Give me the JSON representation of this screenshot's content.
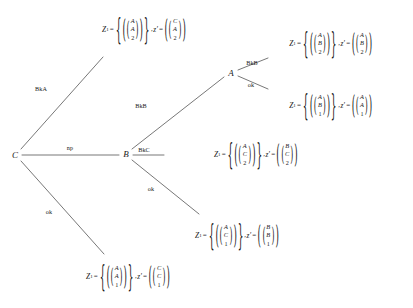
{
  "diagram": {
    "type": "derivation-tree",
    "title": "",
    "background_color": "#ffffff",
    "line_color": "#3c3c3c",
    "text_color": "#1a1a1a",
    "nodes": [
      {
        "id": "root",
        "label": "C",
        "x": 15,
        "y": 155
      },
      {
        "id": "nodeB",
        "label": "B",
        "x": 126,
        "y": 154
      },
      {
        "id": "nodeA",
        "label": "A",
        "x": 231,
        "y": 73
      }
    ],
    "edge_labels": [
      {
        "id": "bka",
        "text": "BkA",
        "x": 41,
        "y": 89
      },
      {
        "id": "np",
        "text": "np",
        "x": 70,
        "y": 148
      },
      {
        "id": "ok_c",
        "text": "ok",
        "x": 49,
        "y": 212
      },
      {
        "id": "bkb_b",
        "text": "BkB",
        "x": 141,
        "y": 106
      },
      {
        "id": "bkc",
        "text": "BkC",
        "x": 144,
        "y": 150
      },
      {
        "id": "ok_b",
        "text": "ok",
        "x": 151,
        "y": 189
      },
      {
        "id": "bkb_a",
        "text": "BkB",
        "x": 252,
        "y": 63
      },
      {
        "id": "ok_a",
        "text": "ok",
        "x": 251,
        "y": 85
      }
    ],
    "expressions": [
      {
        "id": "leaf-bka",
        "x": 144,
        "y": 30,
        "set_symbol": "Z",
        "set_subscript": "1",
        "equals": "=",
        "set_vector": [
          "A",
          "A",
          "2"
        ],
        "separator": ",",
        "z_symbol": "z′",
        "z_equals": "=",
        "z_vector": [
          "C",
          "A",
          "2"
        ]
      },
      {
        "id": "leaf-bkb-a",
        "x": 331,
        "y": 44,
        "set_symbol": "Z",
        "set_subscript": "1",
        "equals": "=",
        "set_vector": [
          "A",
          "B",
          "2"
        ],
        "separator": ",",
        "z_symbol": "z′",
        "z_equals": "=",
        "z_vector": [
          "A",
          "B",
          "2"
        ]
      },
      {
        "id": "leaf-ok-a",
        "x": 331,
        "y": 106,
        "set_symbol": "Z",
        "set_subscript": "1",
        "equals": "=",
        "set_vector": [
          "A",
          "B",
          "1"
        ],
        "separator": ",",
        "z_symbol": "z′",
        "z_equals": "=",
        "z_vector": [
          "A",
          "A",
          "1"
        ]
      },
      {
        "id": "leaf-bkc",
        "x": 256,
        "y": 155,
        "set_symbol": "Z",
        "set_subscript": "1",
        "equals": "=",
        "set_vector": [
          "A",
          "C",
          "2"
        ],
        "separator": ",",
        "z_symbol": "z′",
        "z_equals": "=",
        "z_vector": [
          "B",
          "C",
          "2"
        ]
      },
      {
        "id": "leaf-ok-b",
        "x": 237,
        "y": 236,
        "set_symbol": "Z",
        "set_subscript": "1",
        "equals": "=",
        "set_vector": [
          "A",
          "C",
          "1"
        ],
        "separator": ",",
        "z_symbol": "z′",
        "z_equals": "=",
        "z_vector": [
          "B",
          "B",
          "1"
        ]
      },
      {
        "id": "leaf-ok-c",
        "x": 128,
        "y": 277,
        "set_symbol": "Z",
        "set_subscript": "1",
        "equals": "=",
        "set_vector": [
          "A",
          "A",
          "1"
        ],
        "separator": ",",
        "z_symbol": "z′",
        "z_equals": "=",
        "z_vector": [
          "C",
          "C",
          "1"
        ]
      }
    ]
  }
}
